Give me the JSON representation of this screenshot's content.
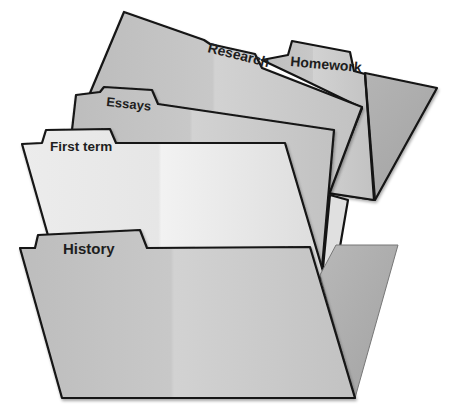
{
  "illustration": {
    "title": "Nested file folders",
    "folders": [
      {
        "id": "research",
        "label": "Research"
      },
      {
        "id": "homework",
        "label": "Homework"
      },
      {
        "id": "essays",
        "label": "Essays"
      },
      {
        "id": "first_term",
        "label": "First term"
      },
      {
        "id": "history",
        "label": "History"
      }
    ]
  },
  "colors": {
    "folder_gray": "#c4c4c4",
    "folder_dark": "#aeaeae",
    "folder_light": "#ebebeb",
    "outline": "#141414",
    "background": "#ffffff"
  }
}
